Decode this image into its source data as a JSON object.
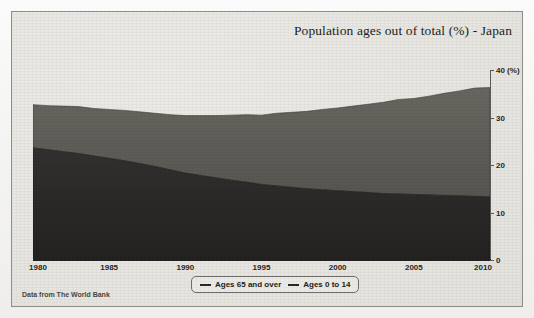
{
  "figure": {
    "source_note": "Data from The World Bank"
  },
  "chart_data": {
    "type": "area",
    "stacked": true,
    "title": "Population ages out of total (%) - Japan",
    "xlabel": "",
    "ylabel": "",
    "yunit": "(%)",
    "ylim": [
      0,
      40
    ],
    "xlim": [
      1980,
      2010
    ],
    "grid": false,
    "y_axis_position": "right",
    "y_ticks": [
      0,
      10,
      20,
      30,
      40
    ],
    "y_tick_labels": [
      "0",
      "10",
      "20",
      "30",
      "40 (%)"
    ],
    "x_ticks": [
      1980,
      1985,
      1990,
      1995,
      2000,
      2005,
      2010
    ],
    "x_tick_labels": [
      "1980",
      "1985",
      "1990",
      "1995",
      "2000",
      "2005",
      "2010"
    ],
    "legend_position": "bottom-center",
    "x": [
      1980,
      1981,
      1982,
      1983,
      1984,
      1985,
      1986,
      1987,
      1988,
      1989,
      1990,
      1991,
      1992,
      1993,
      1994,
      1995,
      1996,
      1997,
      1998,
      1999,
      2000,
      2001,
      2002,
      2003,
      2004,
      2005,
      2006,
      2007,
      2008,
      2009,
      2010
    ],
    "series": [
      {
        "name": "Ages 0 to 14",
        "color": "#2e2d2b",
        "values": [
          23.6,
          23.2,
          22.8,
          22.4,
          21.9,
          21.4,
          20.9,
          20.3,
          19.7,
          19.0,
          18.3,
          17.8,
          17.3,
          16.8,
          16.4,
          15.9,
          15.6,
          15.3,
          15.0,
          14.8,
          14.6,
          14.4,
          14.2,
          14.0,
          13.9,
          13.8,
          13.7,
          13.6,
          13.5,
          13.4,
          13.3
        ]
      },
      {
        "name": "Ages 65 and over",
        "color": "#5a5956",
        "values": [
          9.1,
          9.3,
          9.6,
          9.9,
          10.0,
          10.3,
          10.6,
          10.9,
          11.2,
          11.6,
          12.1,
          12.6,
          13.1,
          13.7,
          14.2,
          14.6,
          15.3,
          15.8,
          16.3,
          16.9,
          17.4,
          18.0,
          18.6,
          19.2,
          19.9,
          20.2,
          20.8,
          21.5,
          22.1,
          22.8,
          23.0
        ]
      }
    ],
    "stack_totals": [
      32.7,
      32.5,
      32.4,
      32.3,
      31.9,
      31.7,
      31.5,
      31.2,
      30.9,
      30.6,
      30.4,
      30.4,
      30.4,
      30.5,
      30.6,
      30.5,
      30.9,
      31.1,
      31.3,
      31.7,
      32.0,
      32.4,
      32.8,
      33.2,
      33.8,
      34.0,
      34.5,
      35.1,
      35.6,
      36.2,
      36.3
    ],
    "legend": [
      {
        "label": "Ages 65 and over"
      },
      {
        "label": "Ages 0 to 14"
      }
    ]
  }
}
